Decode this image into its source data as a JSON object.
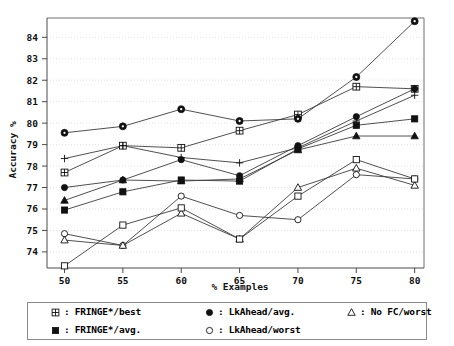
{
  "chart_data": {
    "type": "line",
    "title": "",
    "xlabel": "% Examples",
    "ylabel": "Accuracy %",
    "x": [
      50,
      55,
      60,
      65,
      70,
      75,
      80
    ],
    "xlim": [
      48.5,
      80.8
    ],
    "ylim": [
      73.25,
      84.9
    ],
    "xticks": [
      50,
      55,
      60,
      65,
      70,
      75,
      80
    ],
    "yticks": [
      74,
      75,
      76,
      77,
      78,
      79,
      80,
      81,
      82,
      83,
      84
    ],
    "xticklabels": [
      "50",
      "55",
      "60",
      "65",
      "70",
      "75",
      "80"
    ],
    "yticklabels": [
      "74",
      "75",
      "76",
      "77",
      "78",
      "79",
      "80",
      "81",
      "82",
      "83",
      "84"
    ],
    "grid": true,
    "legend_position": "below-plot",
    "series": [
      {
        "name": "FRINGE*/best",
        "marker": "crossed-square",
        "values": [
          77.7,
          78.95,
          78.85,
          79.65,
          80.4,
          81.7,
          81.6
        ]
      },
      {
        "name": "FRINGE*/avg.",
        "marker": "filled-square",
        "values": [
          75.95,
          76.8,
          77.35,
          77.3,
          78.8,
          79.9,
          80.2
        ]
      },
      {
        "name": "LkAhead/avg.",
        "marker": "filled-circle",
        "values": [
          77.0,
          77.35,
          78.3,
          77.55,
          78.95,
          80.3,
          81.6
        ]
      },
      {
        "name": "LkAhead/worst",
        "marker": "open-circle",
        "values": [
          74.85,
          74.3,
          76.6,
          75.7,
          75.5,
          77.6,
          77.4
        ]
      },
      {
        "name": "No FC/worst",
        "marker": "open-triangle",
        "values": [
          74.55,
          74.3,
          75.8,
          74.6,
          77.0,
          77.9,
          77.1
        ]
      },
      {
        "name": "circle-dot-series",
        "marker": "circle-dot",
        "values": [
          79.55,
          79.85,
          80.65,
          80.1,
          80.2,
          82.15,
          84.75
        ]
      },
      {
        "name": "plus-series",
        "marker": "plus",
        "values": [
          78.35,
          78.95,
          78.4,
          78.15,
          78.85,
          80.1,
          81.3
        ]
      },
      {
        "name": "filled-triangle-series",
        "marker": "filled-triangle",
        "values": [
          76.4,
          77.35,
          77.3,
          77.4,
          78.75,
          79.4,
          79.4
        ]
      },
      {
        "name": "open-square-series",
        "marker": "open-square",
        "values": [
          73.35,
          75.25,
          76.05,
          74.6,
          76.6,
          78.3,
          77.4
        ]
      }
    ]
  },
  "axes": {
    "ylabel": "Accuracy %",
    "xlabel": "% Examples"
  },
  "legend": {
    "entries": [
      {
        "symbol": "crossed-square",
        "label": "FRINGE*/best",
        "colon": ":"
      },
      {
        "symbol": "filled-circle",
        "label": "LkAhead/avg.",
        "colon": ":"
      },
      {
        "symbol": "open-triangle",
        "label": "No FC/worst",
        "colon": ":"
      },
      {
        "symbol": "filled-square",
        "label": "FRINGE*/avg.",
        "colon": ":"
      },
      {
        "symbol": "open-circle",
        "label": "LkAhead/worst",
        "colon": ":"
      }
    ]
  },
  "colors": {
    "line": "#3c3c3c",
    "marker": "#111111",
    "grid": "#d9d9d9",
    "axis": "#4a4a4a",
    "background": "#ffffff"
  }
}
